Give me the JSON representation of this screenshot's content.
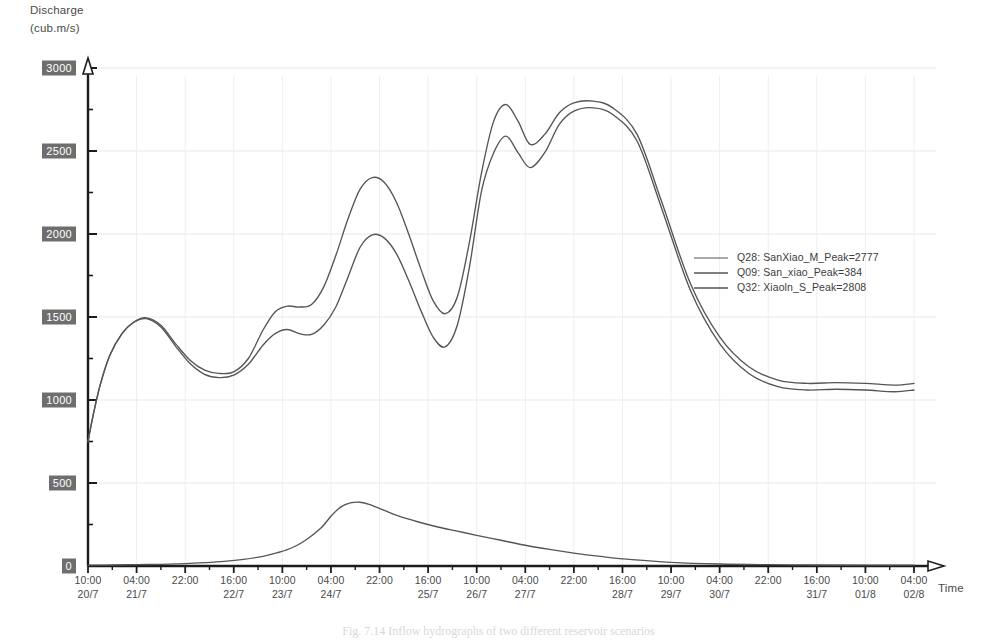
{
  "axes": {
    "y_title_line1": "Discharge",
    "y_title_line2": "(cub.m/s)",
    "x_title": "Time"
  },
  "caption": "Fig. 7.14  Inflow hydrographs of two different reservoir scenarios",
  "legend": {
    "entries": [
      {
        "label": "Q28: SanXiao_M_Peak=2777",
        "color": "#555555"
      },
      {
        "label": "Q09: San_xiao_Peak=384",
        "color": "#555555"
      },
      {
        "label": "Q32: Xiaoln_S_Peak=2808",
        "color": "#555555"
      }
    ]
  },
  "chart_data": {
    "type": "line",
    "title": "",
    "xlabel": "Time",
    "ylabel": "Discharge (cub.m/s)",
    "ylim": [
      0,
      3000
    ],
    "yticks": [
      0,
      500,
      1000,
      1500,
      2000,
      2500,
      3000
    ],
    "grid": true,
    "legend_position": "right-middle",
    "xticks": [
      {
        "time": "10:00",
        "date": "20/7"
      },
      {
        "time": "04:00",
        "date": "21/7"
      },
      {
        "time": "22:00",
        "date": ""
      },
      {
        "time": "16:00",
        "date": "22/7"
      },
      {
        "time": "10:00",
        "date": "23/7"
      },
      {
        "time": "04:00",
        "date": "24/7"
      },
      {
        "time": "22:00",
        "date": ""
      },
      {
        "time": "16:00",
        "date": "25/7"
      },
      {
        "time": "10:00",
        "date": "26/7"
      },
      {
        "time": "04:00",
        "date": "27/7"
      },
      {
        "time": "22:00",
        "date": ""
      },
      {
        "time": "16:00",
        "date": "28/7"
      },
      {
        "time": "10:00",
        "date": "29/7"
      },
      {
        "time": "04:00",
        "date": "30/7"
      },
      {
        "time": "22:00",
        "date": ""
      },
      {
        "time": "16:00",
        "date": "31/7"
      },
      {
        "time": "10:00",
        "date": "01/8"
      },
      {
        "time": "04:00",
        "date": "02/8"
      }
    ],
    "series": [
      {
        "name": "Q28: SanXiao_M_Peak=2777",
        "peak": 2777,
        "color": "#555555",
        "x": [
          0.0,
          0.1,
          0.25,
          0.45,
          0.7,
          0.95,
          1.2,
          1.5,
          1.8,
          2.1,
          2.4,
          2.7,
          3.0,
          3.3,
          3.6,
          3.85,
          4.1,
          4.35,
          4.6,
          4.85,
          5.1,
          5.35,
          5.6,
          5.85,
          6.1,
          6.35,
          6.6,
          6.85,
          7.1,
          7.35,
          7.6,
          7.85,
          8.1,
          8.35,
          8.6,
          8.85,
          9.1,
          9.4,
          9.7,
          10.0,
          10.4,
          10.8,
          11.3,
          11.8,
          12.4,
          13.0,
          13.6,
          14.2,
          14.8,
          15.4,
          16.0,
          16.6,
          17.0
        ],
        "y": [
          750,
          900,
          1090,
          1270,
          1400,
          1470,
          1495,
          1450,
          1340,
          1240,
          1180,
          1160,
          1170,
          1250,
          1420,
          1530,
          1565,
          1560,
          1575,
          1680,
          1870,
          2090,
          2270,
          2340,
          2310,
          2190,
          2000,
          1790,
          1600,
          1520,
          1620,
          1950,
          2370,
          2680,
          2780,
          2680,
          2540,
          2600,
          2730,
          2790,
          2800,
          2760,
          2600,
          2200,
          1700,
          1380,
          1200,
          1120,
          1100,
          1105,
          1100,
          1090,
          1100
        ]
      },
      {
        "name": "Q09: San_xiao_Peak=384",
        "peak": 384,
        "color": "#555555",
        "x": [
          0.0,
          0.5,
          1.0,
          1.5,
          2.0,
          2.4,
          2.8,
          3.2,
          3.6,
          3.9,
          4.2,
          4.5,
          4.8,
          5.0,
          5.2,
          5.4,
          5.6,
          5.8,
          6.1,
          6.4,
          6.8,
          7.2,
          7.6,
          8.0,
          8.5,
          9.0,
          9.5,
          10.0,
          10.6,
          11.2,
          12.0,
          13.0,
          14.0,
          15.0,
          16.0,
          17.0
        ],
        "y": [
          5,
          6,
          8,
          10,
          14,
          20,
          28,
          40,
          58,
          80,
          110,
          160,
          230,
          300,
          355,
          380,
          384,
          370,
          335,
          300,
          265,
          235,
          210,
          185,
          155,
          125,
          100,
          78,
          56,
          38,
          22,
          12,
          8,
          6,
          5,
          5
        ]
      },
      {
        "name": "Q32: Xiaoln_S_Peak=2808",
        "peak": 2808,
        "color": "#555555",
        "x": [
          0.0,
          0.1,
          0.25,
          0.45,
          0.7,
          0.95,
          1.2,
          1.5,
          1.8,
          2.1,
          2.4,
          2.7,
          3.0,
          3.3,
          3.6,
          3.85,
          4.1,
          4.35,
          4.6,
          4.85,
          5.1,
          5.35,
          5.6,
          5.85,
          6.1,
          6.35,
          6.6,
          6.85,
          7.1,
          7.35,
          7.6,
          7.85,
          8.1,
          8.35,
          8.6,
          8.85,
          9.1,
          9.4,
          9.7,
          10.0,
          10.4,
          10.8,
          11.3,
          11.8,
          12.4,
          13.0,
          13.6,
          14.2,
          14.8,
          15.4,
          16.0,
          16.6,
          17.0
        ],
        "y": [
          750,
          900,
          1090,
          1270,
          1400,
          1470,
          1490,
          1440,
          1325,
          1220,
          1155,
          1135,
          1150,
          1215,
          1330,
          1400,
          1425,
          1400,
          1395,
          1450,
          1560,
          1740,
          1920,
          1995,
          1975,
          1880,
          1720,
          1540,
          1380,
          1320,
          1450,
          1800,
          2260,
          2490,
          2590,
          2490,
          2400,
          2490,
          2660,
          2740,
          2760,
          2720,
          2560,
          2160,
          1660,
          1340,
          1160,
          1080,
          1060,
          1065,
          1060,
          1050,
          1060
        ]
      }
    ]
  }
}
